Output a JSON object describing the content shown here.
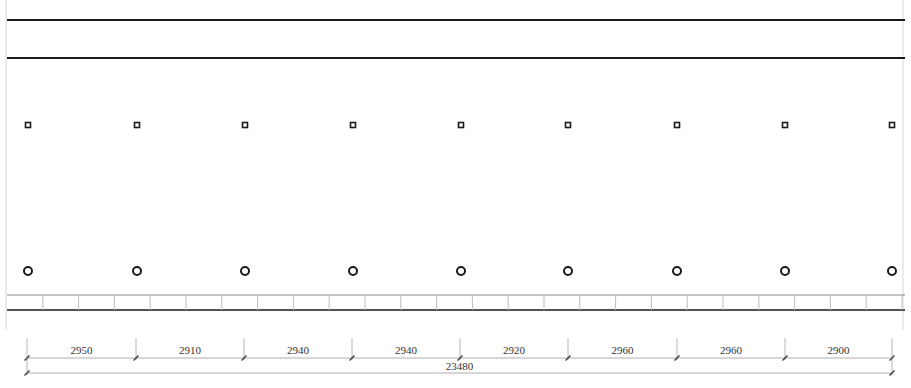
{
  "drawing": {
    "type": "structural plan elevation",
    "colors": {
      "background": "#ffffff",
      "main_line": "#1a1a1a",
      "grid_line": "#bdbdbd",
      "frame_line": "#d8d8d8",
      "dim_line": "#9a9a9a",
      "text": "#333333"
    },
    "bands": {
      "top_line_1_y": 20,
      "top_line_2_y": 58,
      "tile_strip_top_y": 295,
      "tile_strip_bottom_y": 310
    },
    "columns": {
      "x": [
        28,
        137,
        245,
        353,
        461,
        568,
        677,
        785,
        892
      ],
      "square_marker_y": 125,
      "circle_marker_y": 271
    },
    "tile_strip": {
      "x_start": 7,
      "x_end": 905,
      "cell_width": 35.8
    },
    "dimensions": {
      "spans": [
        {
          "label": "2950",
          "x1": 27,
          "x2": 136
        },
        {
          "label": "2910",
          "x1": 136,
          "x2": 244
        },
        {
          "label": "2940",
          "x1": 244,
          "x2": 352
        },
        {
          "label": "2940",
          "x1": 352,
          "x2": 460
        },
        {
          "label": "2920",
          "x1": 460,
          "x2": 568
        },
        {
          "label": "2960",
          "x1": 568,
          "x2": 677
        },
        {
          "label": "2960",
          "x1": 677,
          "x2": 785
        },
        {
          "label": "2900",
          "x1": 785,
          "x2": 892
        }
      ],
      "total": {
        "label": "23480",
        "x1": 27,
        "x2": 892
      },
      "span_line_y": 358,
      "total_line_y": 373
    }
  }
}
